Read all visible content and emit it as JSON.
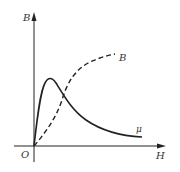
{
  "diagram": {
    "title": "",
    "axes": {
      "y_label": "B",
      "x_label": "H",
      "origin_label": "O"
    },
    "curves": [
      {
        "name": "permeability",
        "label": "μ",
        "style": "solid",
        "description": "rises steeply from origin to a peak, then decays"
      },
      {
        "name": "flux-density",
        "label": "B",
        "style": "dashed",
        "description": "magnetization curve rising from origin and saturating"
      }
    ],
    "colors": {
      "stroke": "#222222",
      "background": "#ffffff"
    }
  }
}
